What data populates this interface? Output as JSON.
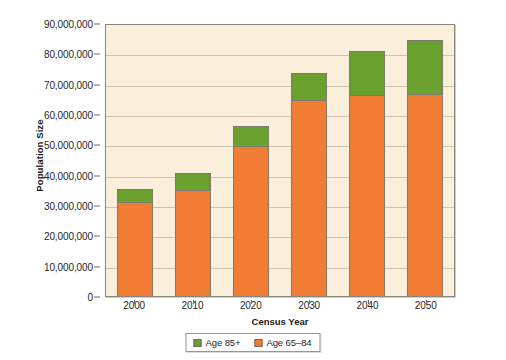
{
  "chart_data": {
    "type": "bar",
    "subtype": "stacked-bar",
    "title": "",
    "xlabel": "Census Year",
    "ylabel": "Population Size",
    "categories": [
      "2000",
      "2010",
      "2020",
      "2030",
      "2040",
      "2050"
    ],
    "series": [
      {
        "name": "Age 65–84",
        "color": "#f07d33",
        "values": [
          31000000,
          35000000,
          49500000,
          64500000,
          66300000,
          66500000
        ]
      },
      {
        "name": "Age 85+",
        "color": "#6aa02e",
        "values": [
          4300000,
          5500000,
          6500000,
          9000000,
          14500000,
          18000000
        ]
      }
    ],
    "totals": [
      35300000,
      40500000,
      56000000,
      73500000,
      80800000,
      84500000
    ],
    "ylim": [
      0,
      90000000
    ],
    "ytick_values": [
      0,
      10000000,
      20000000,
      30000000,
      40000000,
      50000000,
      60000000,
      70000000,
      80000000,
      90000000
    ],
    "ytick_labels": [
      "0",
      "10,000,000",
      "20,000,000",
      "30,000,000",
      "40,000,000",
      "50,000,000",
      "60,000,000",
      "70,000,000",
      "80,000,000",
      "90,000,000"
    ],
    "grid": true,
    "grid_axis": "y",
    "legend_position": "bottom-center",
    "legend_entries": [
      {
        "label": "Age 85+",
        "color": "#6aa02e"
      },
      {
        "label": "Age 65–84",
        "color": "#f07d33"
      }
    ],
    "plot_background": "#fbeeda",
    "figure_background": "#ffffff",
    "gridline_color": "#cfc3ad",
    "axis_color": "#8a857a",
    "bar_outline_color": "#7d7a6e"
  }
}
